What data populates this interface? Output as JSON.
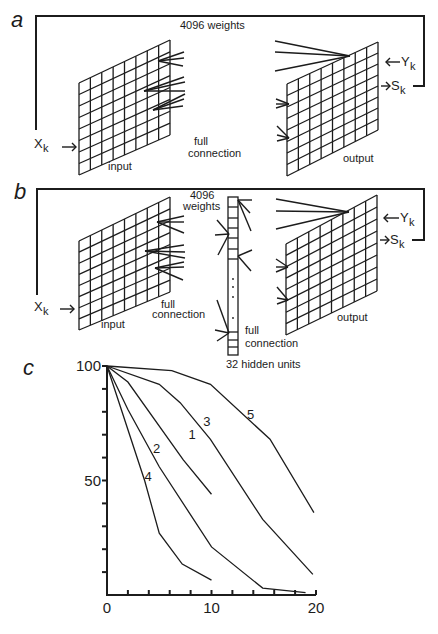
{
  "colors": {
    "ink": "#1c1c1c",
    "background": "#ffffff"
  },
  "panel_a": {
    "label": "a",
    "weights_label": "4096 weights",
    "input_label": "input",
    "output_label": "output",
    "connection_label_line1": "full",
    "connection_label_line2": "connection",
    "x_label": "X",
    "x_sub": "k",
    "y_label": "Y",
    "y_sub": "k",
    "s_label": "S",
    "s_sub": "k",
    "input_grid": {
      "x0": 79,
      "x1": 170,
      "top0": 83,
      "bot0": 175,
      "top1": 40,
      "bot1": 135,
      "cols": 8,
      "rows": 8
    },
    "output_grid": {
      "x0": 287,
      "x1": 378,
      "top0": 84,
      "bot0": 176,
      "top1": 42,
      "bot1": 130,
      "cols": 8,
      "rows": 8
    },
    "feedback": [
      [
        36,
        130
      ],
      [
        36,
        16
      ],
      [
        424,
        16
      ],
      [
        424,
        86
      ],
      [
        413,
        86
      ]
    ],
    "input_fans": [
      {
        "to": [
          158,
          61
        ],
        "from": [
          [
            184,
            52
          ],
          [
            184,
            58
          ],
          [
            183,
            66
          ]
        ]
      },
      {
        "to": [
          144,
          91
        ],
        "from": [
          [
            184,
            77
          ],
          [
            185,
            82
          ],
          [
            185,
            91
          ]
        ]
      },
      {
        "to": [
          153,
          110
        ],
        "from": [
          [
            185,
            94
          ],
          [
            184,
            99
          ],
          [
            183,
            106
          ]
        ]
      }
    ],
    "output_fans": [
      {
        "to": [
          350,
          56
        ],
        "from": [
          [
            275,
            41
          ],
          [
            275,
            52
          ],
          [
            275,
            71
          ]
        ]
      },
      {
        "to": [
          289,
          104
        ],
        "from": [
          [
            276,
            99
          ],
          [
            276,
            104
          ],
          [
            276,
            108
          ]
        ]
      },
      {
        "to": [
          289,
          138
        ],
        "from": [
          [
            277,
            126
          ],
          [
            277,
            135
          ],
          [
            277,
            141
          ]
        ]
      }
    ]
  },
  "panel_b": {
    "label": "b",
    "weights_label_line1": "4096",
    "weights_label_line2": "weights",
    "input_label": "input",
    "output_label": "output",
    "connection1_line1": "full",
    "connection1_line2": "connection",
    "connection2_line1": "full",
    "connection2_line2": "connection",
    "hidden_label": "32 hidden units",
    "x_label": "X",
    "x_sub": "k",
    "y_label": "Y",
    "y_sub": "k",
    "s_label": "S",
    "s_sub": "k",
    "input_grid": {
      "x0": 79,
      "x1": 170,
      "top0": 241,
      "bot0": 330,
      "top1": 197,
      "bot1": 292,
      "cols": 8,
      "rows": 8
    },
    "output_grid": {
      "x0": 286,
      "x1": 377,
      "top0": 244,
      "bot0": 335,
      "top1": 195,
      "bot1": 291,
      "cols": 8,
      "rows": 8
    },
    "hidden_column": {
      "x0": 228,
      "x1": 238,
      "top": 197,
      "bottom": 355,
      "top_dividers": [
        207,
        218,
        228,
        238,
        249,
        259
      ],
      "bottom_dividers": [
        332,
        340,
        347
      ],
      "dots_y": [
        279,
        287,
        297,
        318
      ]
    },
    "feedback": [
      [
        37,
        295
      ],
      [
        37,
        189
      ],
      [
        424,
        189
      ],
      [
        424,
        240
      ],
      [
        412,
        240
      ]
    ],
    "input_fans": [
      {
        "to": [
          157,
          222
        ],
        "from": [
          [
            184,
            216
          ],
          [
            184,
            222
          ],
          [
            184,
            233
          ]
        ]
      },
      {
        "to": [
          145,
          251
        ],
        "from": [
          [
            184,
            245
          ],
          [
            185,
            252
          ],
          [
            185,
            258
          ]
        ]
      },
      {
        "to": [
          155,
          268
        ],
        "from": [
          [
            184,
            262
          ],
          [
            184,
            267
          ],
          [
            183,
            280
          ]
        ]
      }
    ],
    "hidden_fans": [
      {
        "to": [
          229,
          234
        ],
        "from": [
          [
            217,
            220
          ],
          [
            215,
            235
          ],
          [
            218,
            255
          ]
        ]
      },
      {
        "to": [
          229,
          333
        ],
        "from": [
          [
            217,
            300
          ],
          [
            215,
            330
          ],
          [
            217,
            341
          ]
        ]
      }
    ],
    "hidden_out_fans": [
      {
        "to": [
          238,
          200
        ],
        "from": [
          [
            252,
            200
          ],
          [
            250,
            213
          ],
          [
            251,
            231
          ]
        ]
      },
      {
        "to": [
          238,
          256
        ],
        "from": [
          [
            252,
            250
          ],
          [
            251,
            271
          ]
        ]
      }
    ],
    "output_fans": [
      {
        "to": [
          349,
          212
        ],
        "from": [
          [
            276,
            199
          ],
          [
            276,
            211
          ],
          [
            276,
            229
          ]
        ]
      },
      {
        "to": [
          288,
          267
        ],
        "from": [
          [
            276,
            259
          ],
          [
            276,
            267
          ],
          [
            276,
            272
          ]
        ]
      },
      {
        "to": [
          288,
          300
        ],
        "from": [
          [
            277,
            287
          ],
          [
            277,
            298
          ],
          [
            277,
            304
          ]
        ]
      }
    ]
  },
  "panel_c": {
    "label": "c"
  },
  "chart_data": {
    "type": "line",
    "title": "",
    "xlabel": "",
    "ylabel": "",
    "xlim": [
      0,
      20
    ],
    "ylim": [
      0,
      100
    ],
    "x_ticks": [
      0,
      10,
      20
    ],
    "x_tick_labels": [
      "0",
      "10",
      "20"
    ],
    "x_minor_ticks": [
      2,
      4,
      6,
      8,
      12,
      14,
      16,
      18
    ],
    "y_ticks": [
      50,
      100
    ],
    "y_tick_labels": [
      "50",
      "100"
    ],
    "y_minor_ticks": [
      10,
      20,
      30,
      40,
      60,
      70,
      80,
      90
    ],
    "grid": false,
    "legend": "inline curve labels",
    "series": [
      {
        "name": "1",
        "x": [
          0,
          2,
          7.3,
          10
        ],
        "y": [
          100,
          93,
          59,
          44
        ],
        "label_pos": [
          7.8,
          68
        ]
      },
      {
        "name": "2",
        "x": [
          0,
          2,
          5,
          10,
          14.9,
          19
        ],
        "y": [
          100,
          81,
          56,
          21,
          3,
          1
        ],
        "label_pos": [
          4.4,
          62
        ]
      },
      {
        "name": "3",
        "x": [
          0,
          5,
          7,
          9.9,
          14.9,
          19.7
        ],
        "y": [
          100,
          92,
          84,
          68,
          33,
          9
        ],
        "label_pos": [
          9.2,
          74
        ]
      },
      {
        "name": "4",
        "x": [
          0,
          3.6,
          5,
          7.2,
          10
        ],
        "y": [
          100,
          50,
          27,
          13.5,
          6.5
        ],
        "label_pos": [
          3.6,
          50
        ]
      },
      {
        "name": "5",
        "x": [
          0,
          6.2,
          9.9,
          15.6,
          19.8
        ],
        "y": [
          100,
          98,
          92,
          68,
          36
        ],
        "label_pos": [
          13.4,
          77
        ]
      }
    ]
  },
  "chart_geometry": {
    "x0px": 107,
    "x20px": 316,
    "y0px": 595,
    "y100px": 366
  }
}
